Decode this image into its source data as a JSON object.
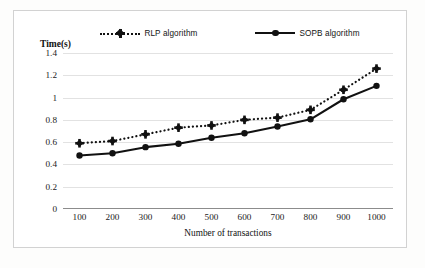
{
  "chart_data": {
    "type": "line",
    "title": "",
    "xlabel": "Number of transactions",
    "ylabel": "Time(s)",
    "x": [
      100,
      200,
      300,
      400,
      500,
      600,
      700,
      800,
      900,
      1000
    ],
    "categories": [
      "100",
      "200",
      "300",
      "400",
      "500",
      "600",
      "700",
      "800",
      "900",
      "1000"
    ],
    "xtick_labels": [
      "100",
      "200",
      "300",
      "400",
      "500",
      "600",
      "700",
      "800",
      "900",
      "1000"
    ],
    "ytick_labels": [
      "0",
      "0.2",
      "0.4",
      "0.6",
      "0.8",
      "1",
      "1.2",
      "1.4"
    ],
    "ytick_values": [
      0,
      0.2,
      0.4,
      0.6,
      0.8,
      1,
      1.2,
      1.4
    ],
    "ylim": [
      0,
      1.4
    ],
    "grid": true,
    "legend_position": "top",
    "series": [
      {
        "name": "RLP algorithm",
        "style": "dotted",
        "marker": "cross-diamond",
        "color": "#111111",
        "values": [
          0.59,
          0.61,
          0.67,
          0.73,
          0.75,
          0.8,
          0.82,
          0.89,
          1.07,
          1.26
        ]
      },
      {
        "name": "SOPB algorithm",
        "style": "solid",
        "marker": "circle",
        "color": "#111111",
        "values": [
          0.48,
          0.5,
          0.555,
          0.585,
          0.64,
          0.68,
          0.74,
          0.805,
          0.985,
          1.105
        ]
      }
    ]
  },
  "legend": {
    "entries": [
      {
        "label": "RLP algorithm",
        "key_icon": "dotted-line-cross-marker-icon"
      },
      {
        "label": "SOPB algorithm",
        "key_icon": "solid-line-circle-marker-icon"
      }
    ]
  },
  "axis": {
    "y_title": "Time(s)",
    "x_title": "Number of transactions"
  }
}
